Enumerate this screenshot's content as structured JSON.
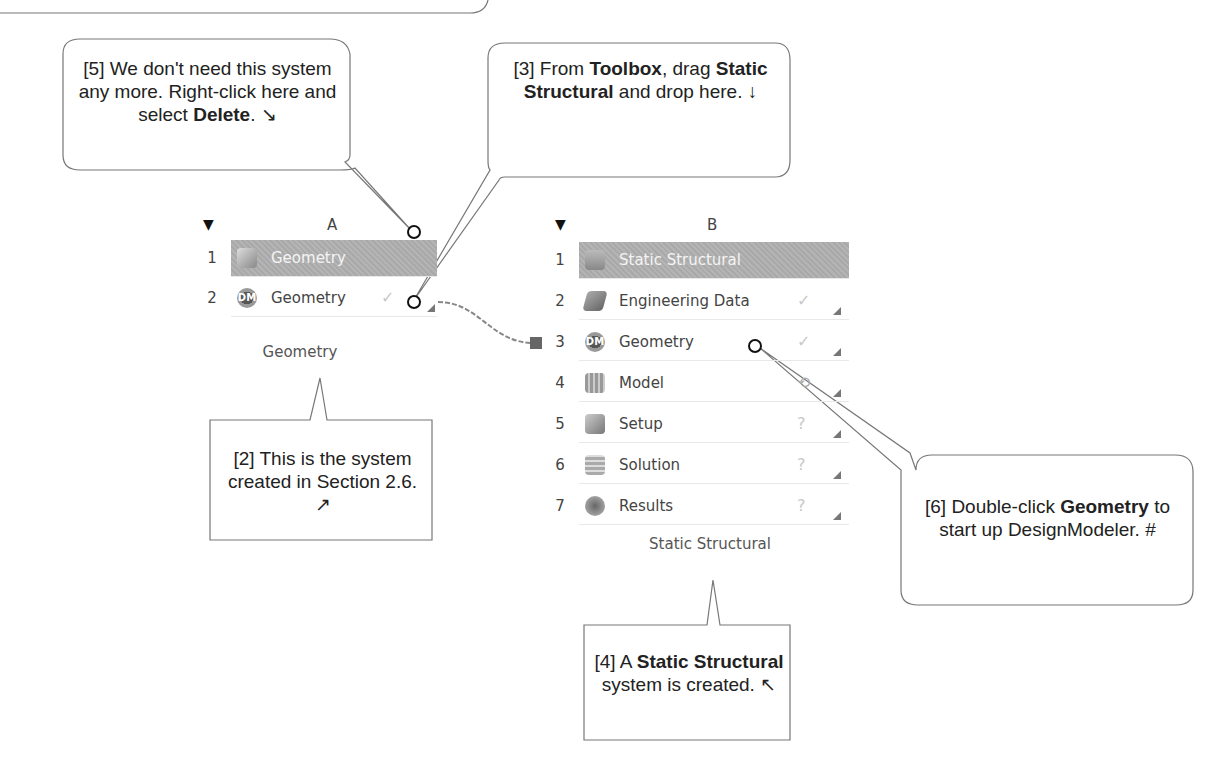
{
  "callouts": {
    "c5": {
      "prefix": "[5] We don't need this system any more.  Right-click here and select ",
      "bold": "Delete",
      "suffix": ".  ↘"
    },
    "c3": {
      "prefix": "[3] From ",
      "bold1": "Toolbox",
      "mid": ", drag ",
      "bold2": "Static Structural",
      "suffix": " and drop here. ↓"
    },
    "c2": {
      "text": "[2] This is the system created in Section 2.6.  ↗"
    },
    "c4": {
      "prefix": "[4] A ",
      "bold": "Static Structural",
      "suffix": " system is created.  ↖"
    },
    "c6": {
      "prefix": "[6] Double-click ",
      "bold": "Geometry",
      "suffix": " to start up DesignModeler.  #"
    }
  },
  "system_a": {
    "column": "A",
    "caption": "Geometry",
    "rows": [
      {
        "num": "1",
        "label": "Geometry",
        "icon": "geometry-cube-icon",
        "status": ""
      },
      {
        "num": "2",
        "label": "Geometry",
        "icon": "designmodeler-icon",
        "status": "✓"
      }
    ]
  },
  "system_b": {
    "column": "B",
    "caption": "Static Structural",
    "rows": [
      {
        "num": "1",
        "label": "Static Structural",
        "icon": "static-structural-icon",
        "status": ""
      },
      {
        "num": "2",
        "label": "Engineering Data",
        "icon": "engineering-data-icon",
        "status": "✓"
      },
      {
        "num": "3",
        "label": "Geometry",
        "icon": "designmodeler-icon",
        "status": "✓"
      },
      {
        "num": "4",
        "label": "Model",
        "icon": "model-icon",
        "status": "⟲"
      },
      {
        "num": "5",
        "label": "Setup",
        "icon": "setup-icon",
        "status": "?"
      },
      {
        "num": "6",
        "label": "Solution",
        "icon": "solution-icon",
        "status": "?"
      },
      {
        "num": "7",
        "label": "Results",
        "icon": "results-icon",
        "status": "?"
      }
    ]
  },
  "icons": {
    "collapse": "▼",
    "dm_text": "DM"
  }
}
